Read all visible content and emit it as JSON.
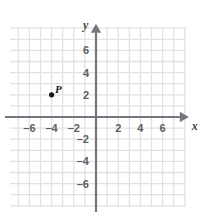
{
  "chart_data": {
    "type": "scatter",
    "title": "",
    "xlabel": "x",
    "ylabel": "y",
    "xlim": [
      -7.8,
      8.1
    ],
    "ylim": [
      -8.2,
      8.2
    ],
    "grid": true,
    "grid_step": 1,
    "legend": "none",
    "axis_labels": {
      "x": "x",
      "y": "y"
    },
    "xticks": [
      -6,
      -4,
      -2,
      2,
      4,
      6
    ],
    "yticks": [
      6,
      4,
      2,
      -2,
      -4,
      -6
    ],
    "xtick_labels": [
      "–6",
      "–4",
      "–2",
      "2",
      "4",
      "6"
    ],
    "ytick_labels": [
      "6",
      "4",
      "2",
      "–2",
      "–4",
      "–6"
    ],
    "points": [
      {
        "label": "P",
        "x": -4,
        "y": 2
      }
    ],
    "colors": {
      "background": "#ffffff",
      "grid": "#e2e2e6",
      "axis": "#76767e",
      "point": "#18181a",
      "tick_text": "#5d5d63",
      "axis_text": "#3f3f45"
    }
  }
}
